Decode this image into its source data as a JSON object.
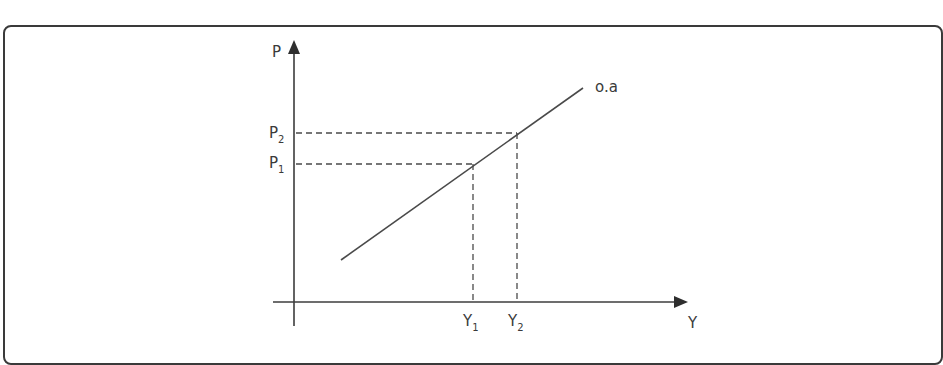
{
  "diagram": {
    "type": "economics-supply-curve",
    "axes": {
      "y_axis_label": "P",
      "x_axis_label": "Y"
    },
    "curve": {
      "label": "o.a",
      "start": {
        "x": 341,
        "y": 260
      },
      "end": {
        "x": 583,
        "y": 88
      }
    },
    "price_levels": [
      {
        "label": "P",
        "subscript": "1"
      },
      {
        "label": "P",
        "subscript": "2"
      }
    ],
    "output_levels": [
      {
        "label": "Y",
        "subscript": "1"
      },
      {
        "label": "Y",
        "subscript": "2"
      }
    ],
    "points": [
      {
        "name": "point-1",
        "price": "P1",
        "output": "Y1",
        "x": 473,
        "y": 164
      },
      {
        "name": "point-2",
        "price": "P2",
        "output": "Y2",
        "x": 517,
        "y": 133
      }
    ]
  },
  "colors": {
    "line": "#4a4a4a",
    "frame": "#3a3a3a",
    "background": "#ffffff"
  }
}
